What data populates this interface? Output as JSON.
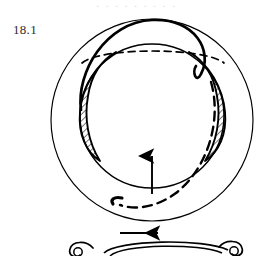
{
  "figure": {
    "label": "18.1",
    "caption_bleed": ". .  . . .        . .           . .",
    "domain_note": "topological sphere diagram",
    "ink_color": "#000000",
    "label_color": "#2b2b2b",
    "background_color": "#ffffff"
  },
  "upper_figure": {
    "name": "sphere-in-sphere-with-lunes",
    "outer_sphere": {
      "name": "outer-circle",
      "cx": 152,
      "cy": 120,
      "r": 101,
      "stroke_width": 1.1
    },
    "inner_sphere": {
      "name": "inner-circle",
      "cx": 152,
      "cy": 116,
      "r": 72,
      "stroke_width": 1.4
    },
    "equator_dashed": {
      "name": "equator-back-arc",
      "dash": "7 5",
      "stroke_width": 1.6
    },
    "lune_left": {
      "name": "hatched-lune-left",
      "hatch_angle_deg": 45,
      "hatch_spacing": 3.2,
      "stroke_width": 0.8
    },
    "lune_right": {
      "name": "hatched-lune-right",
      "hatch_angle_deg": 45,
      "hatch_spacing": 3.2,
      "stroke_width": 0.8
    },
    "solid_curve": {
      "name": "solid-great-circle-front",
      "stroke_width": 2.6
    },
    "dashed_curve": {
      "name": "dashed-great-circle-back",
      "dash": "9 6",
      "stroke_width": 2.4
    },
    "arrow_up": {
      "name": "up-arrow",
      "x": 152,
      "y_tail": 193,
      "y_head": 152,
      "stroke_width": 1.8
    }
  },
  "lower_figure": {
    "name": "partial-torus-figure",
    "arrow_right": {
      "name": "right-arrow",
      "x_tail": 120,
      "x_head": 163,
      "y": 233,
      "stroke_width": 1.8
    },
    "curl_left": {
      "name": "spiral-curl-left",
      "cx": 82,
      "cy": 251
    },
    "curl_right": {
      "name": "spiral-curl-right",
      "cx": 231,
      "cy": 250
    },
    "body": {
      "name": "tube-outline",
      "stroke_width": 1.6
    }
  }
}
